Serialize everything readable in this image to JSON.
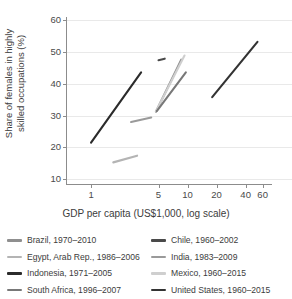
{
  "chart_data": {
    "type": "line",
    "title": "",
    "xlabel": "GDP per capita (US$1,000, log scale)",
    "ylabel": "Share of females in highly skilled occupations (%)",
    "ylabel_line1": "Share of females in highly",
    "ylabel_line2": "skilled occupations (%)",
    "xscale": "log",
    "xlim": [
      0.55,
      75
    ],
    "ylim": [
      8.5,
      61
    ],
    "xticks": [
      1,
      5,
      10,
      20,
      40,
      60
    ],
    "xtick_labels": [
      "1",
      "5",
      "10",
      "20",
      "40",
      "60"
    ],
    "yticks": [
      10,
      20,
      30,
      40,
      50,
      60
    ],
    "ytick_labels": [
      "10",
      "20",
      "30",
      "40",
      "50",
      "60"
    ],
    "grid": "horizontal",
    "legend_position": "bottom",
    "series": [
      {
        "name": "Brazil, 1970–2010",
        "label": "Brazil, 1970–2010",
        "color": "#8f8f8f",
        "points": [
          [
            4.7,
            31.2
          ],
          [
            8.6,
            47.6
          ]
        ]
      },
      {
        "name": "Chile, 1960–2002",
        "label": "Chile, 1960–2002",
        "color": "#4a4a4a",
        "points": [
          [
            5.0,
            47.4
          ],
          [
            5.8,
            47.9
          ]
        ]
      },
      {
        "name": "Egypt, Arab Rep., 1986–2006",
        "label": "Egypt, Arab Rep., 1986–2006",
        "color": "#b4b4b4",
        "points": [
          [
            1.7,
            15.3
          ],
          [
            3.0,
            17.4
          ]
        ]
      },
      {
        "name": "India, 1983–2009",
        "label": "India, 1983–2009",
        "color": "#9a9a9a",
        "points": [
          [
            2.6,
            28.0
          ],
          [
            4.2,
            29.4
          ]
        ]
      },
      {
        "name": "Indonesia, 1971–2005",
        "label": "Indonesia, 1971–2005",
        "color": "#2b2b2b",
        "points": [
          [
            1.0,
            21.5
          ],
          [
            3.3,
            43.6
          ]
        ]
      },
      {
        "name": "Mexico, 1960–2015",
        "label": "Mexico, 1960–2015",
        "color": "#cfcfcf",
        "points": [
          [
            4.7,
            31.3
          ],
          [
            9.3,
            48.9
          ]
        ]
      },
      {
        "name": "South Africa, 1996–2007",
        "label": "South Africa, 1996–2007",
        "color": "#787878",
        "points": [
          [
            4.8,
            31.4
          ],
          [
            9.6,
            43.6
          ]
        ]
      },
      {
        "name": "United States, 1960–2015",
        "label": "United States, 1960–2015",
        "color": "#333333",
        "points": [
          [
            18.0,
            35.8
          ],
          [
            53.0,
            53.2
          ]
        ]
      }
    ]
  },
  "legend": {
    "left_items": [
      {
        "label": "Brazil, 1970–2010",
        "color": "#8f8f8f"
      },
      {
        "label": "Egypt, Arab Rep., 1986–2006",
        "color": "#b4b4b4"
      },
      {
        "label": "Indonesia, 1971–2005",
        "color": "#2b2b2b"
      },
      {
        "label": "South Africa, 1996–2007",
        "color": "#787878"
      }
    ],
    "right_items": [
      {
        "label": "Chile, 1960–2002",
        "color": "#4a4a4a"
      },
      {
        "label": "India, 1983–2009",
        "color": "#9a9a9a"
      },
      {
        "label": "Mexico, 1960–2015",
        "color": "#cfcfcf"
      },
      {
        "label": "United States, 1960–2015",
        "color": "#333333"
      }
    ]
  }
}
